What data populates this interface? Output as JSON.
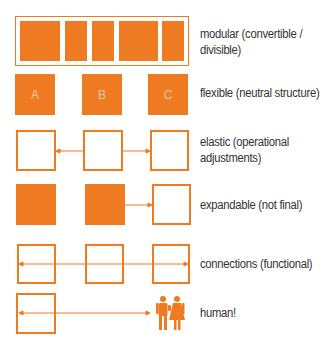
{
  "accent_color": "#EE7A22",
  "rows": [
    {
      "label_line1": "modular (convertible /",
      "label_line2": "divisible)"
    },
    {
      "label_line1": "flexible (neutral structure)",
      "boxes": [
        "A",
        "B",
        "C"
      ]
    },
    {
      "label_line1": "elastic (operational",
      "label_line2": "adjustments)"
    },
    {
      "label_line1": "expandable (not final)"
    },
    {
      "label_line1": "connections (functional)"
    },
    {
      "label_line1": "human!",
      "icon": "people-icon"
    }
  ]
}
